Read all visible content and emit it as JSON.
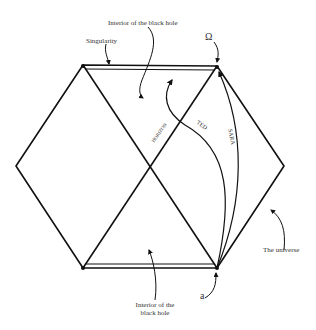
{
  "diagram": {
    "type": "penrose-diagram",
    "stroke_color": "#111111",
    "labels": {
      "interior_top": "Interior of the black hole",
      "singularity": "Singularity",
      "omega": "Ω",
      "horizon": "HORIZON",
      "ted": "TED",
      "sara": "SARA",
      "universe": "The universe",
      "interior_bottom_line1": "Interior of the",
      "interior_bottom_line2": "black hole",
      "alpha": "a"
    }
  }
}
